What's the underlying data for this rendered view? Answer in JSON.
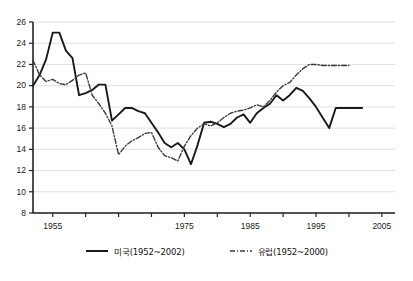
{
  "chart_data": {
    "type": "line",
    "title": "",
    "subtitle": "",
    "xlabel": "",
    "ylabel": "",
    "xlim": [
      1952,
      2007
    ],
    "ylim": [
      8,
      26
    ],
    "y_ticks": [
      8,
      10,
      12,
      14,
      16,
      18,
      20,
      22,
      24,
      26
    ],
    "x_ticks": [
      1955,
      1960,
      1965,
      1970,
      1975,
      1980,
      1985,
      1990,
      1995,
      2000,
      2005
    ],
    "x_tick_labels": [
      "1955",
      "",
      "",
      "",
      "1975",
      "",
      "1985",
      "",
      "1995",
      "",
      "2005"
    ],
    "grid": "horizontal",
    "legend_position": "bottom",
    "series": [
      {
        "name": "미국(1952~2002)",
        "style": "solid",
        "color": "#1a1a1a",
        "x": [
          1952,
          1953,
          1954,
          1955,
          1956,
          1957,
          1958,
          1959,
          1960,
          1961,
          1962,
          1963,
          1964,
          1965,
          1966,
          1967,
          1968,
          1969,
          1970,
          1971,
          1972,
          1973,
          1974,
          1975,
          1976,
          1977,
          1978,
          1979,
          1980,
          1981,
          1982,
          1983,
          1984,
          1985,
          1986,
          1987,
          1988,
          1989,
          1990,
          1991,
          1992,
          1993,
          1994,
          1995,
          1996,
          1997,
          1998,
          1999,
          2000,
          2001,
          2002
        ],
        "y": [
          20.0,
          21.0,
          22.5,
          25.0,
          25.0,
          23.3,
          22.6,
          19.1,
          19.3,
          19.6,
          20.1,
          20.1,
          16.7,
          17.3,
          17.9,
          17.9,
          17.6,
          17.4,
          16.5,
          15.6,
          14.6,
          14.2,
          14.6,
          14.0,
          12.6,
          14.4,
          16.5,
          16.6,
          16.4,
          16.1,
          16.4,
          17.0,
          17.3,
          16.5,
          17.4,
          17.9,
          18.3,
          19.1,
          18.6,
          19.1,
          19.8,
          19.5,
          18.8,
          18.0,
          17.0,
          16.0,
          17.9,
          17.9,
          17.9,
          17.9,
          17.9
        ]
      },
      {
        "name": "유럽(1952~2000)",
        "style": "dash-dot",
        "color": "#3a3a3a",
        "x": [
          1952,
          1953,
          1954,
          1955,
          1956,
          1957,
          1958,
          1959,
          1960,
          1961,
          1962,
          1963,
          1964,
          1965,
          1966,
          1967,
          1968,
          1969,
          1970,
          1971,
          1972,
          1973,
          1974,
          1975,
          1976,
          1977,
          1978,
          1979,
          1980,
          1981,
          1982,
          1983,
          1984,
          1985,
          1986,
          1987,
          1988,
          1989,
          1990,
          1991,
          1992,
          1993,
          1994,
          1995,
          1996,
          1997,
          1998,
          1999,
          2000
        ],
        "y": [
          22.4,
          21.0,
          20.4,
          20.6,
          20.2,
          20.1,
          20.5,
          21.0,
          21.2,
          19.1,
          18.3,
          17.4,
          16.2,
          13.5,
          14.3,
          14.8,
          15.1,
          15.5,
          15.6,
          14.2,
          13.4,
          13.2,
          12.9,
          14.3,
          15.3,
          16.0,
          16.4,
          16.2,
          16.5,
          17.0,
          17.4,
          17.6,
          17.7,
          17.9,
          18.2,
          18.0,
          18.6,
          19.4,
          20.0,
          20.3,
          21.0,
          21.6,
          22.0,
          22.0,
          21.9,
          21.9,
          21.9,
          21.9,
          21.9
        ]
      }
    ]
  },
  "axis": {
    "y_labels": [
      "26",
      "24",
      "22",
      "20",
      "18",
      "16",
      "14",
      "12",
      "10",
      "8"
    ],
    "x_labels": [
      "1955",
      "1975",
      "1985",
      "1995",
      "2005"
    ]
  },
  "legend": {
    "items": [
      {
        "label": "미국(1952~2002)",
        "style": "solid"
      },
      {
        "label": "유럽(1952~2000)",
        "style": "dash-dot"
      }
    ]
  },
  "colors": {
    "series_us": "#1a1a1a",
    "series_eu": "#3a3a3a",
    "grid": "#d8d8d8",
    "axis": "#222222",
    "background": "#ffffff"
  }
}
